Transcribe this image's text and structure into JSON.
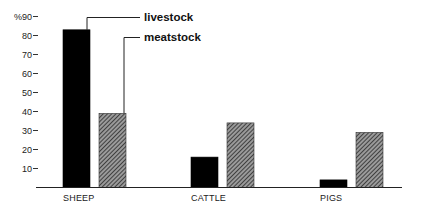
{
  "chart_data": {
    "type": "bar",
    "title": "",
    "xlabel": "",
    "ylabel": "%",
    "ylim": [
      0,
      90
    ],
    "yticks": [
      10,
      20,
      30,
      40,
      50,
      60,
      70,
      80,
      90
    ],
    "ytick_labels": [
      "10",
      "20",
      "30",
      "40",
      "50",
      "60",
      "70",
      "80",
      "%90"
    ],
    "grid": false,
    "legend_position": "callout lines, top",
    "categories": [
      "SHEEP",
      "CATTLE",
      "PIGS"
    ],
    "series": [
      {
        "name": "livestock",
        "values": [
          83,
          16,
          4
        ],
        "fill": "#000000",
        "pattern": "solid"
      },
      {
        "name": "meatstock",
        "values": [
          39,
          34,
          29
        ],
        "fill": "#555555",
        "pattern": "hatched"
      }
    ]
  }
}
